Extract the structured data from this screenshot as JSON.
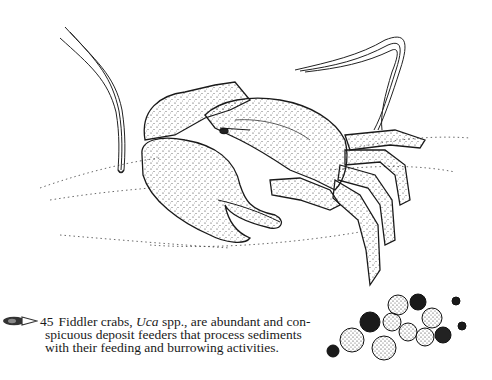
{
  "figure": {
    "elements": [
      "seagrass-blade-left",
      "seagrass-blade-right",
      "fiddler-crab",
      "sediment-surface",
      "feeding-pellets"
    ]
  },
  "caption": {
    "icon": "eye-pointer-icon",
    "number": "45",
    "line1_pre": "Fiddler crabs, ",
    "line1_italic": "Uca",
    "line1_post": " spp., are abundant and con-",
    "line2": "spicuous deposit feeders that process sediments",
    "line3": "with their feeding and burrowing activities."
  },
  "colors": {
    "ink": "#1a1a1a",
    "paper": "#ffffff"
  }
}
